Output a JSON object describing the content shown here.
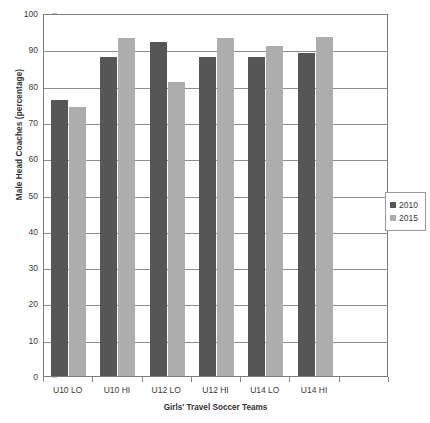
{
  "chart_data": {
    "type": "bar",
    "title": "",
    "xlabel": "Girls' Travel Soccer Teams",
    "ylabel": "Male Head Coaches (percentage)",
    "categories": [
      "U10 LO",
      "U10 HI",
      "U12 LO",
      "U12 HI",
      "U14 LO",
      "U14 HI"
    ],
    "series": [
      {
        "name": "2010",
        "color": "#565656",
        "values": [
          76,
          88,
          92,
          88,
          88,
          89
        ]
      },
      {
        "name": "2015",
        "color": "#adadad",
        "values": [
          74,
          93,
          81,
          93,
          91,
          93.5
        ]
      }
    ],
    "ylim": [
      0,
      100
    ],
    "yticks": [
      0,
      10,
      20,
      30,
      40,
      50,
      60,
      70,
      80,
      90,
      100
    ],
    "ytick_labels": [
      "0",
      "10",
      "20",
      "30",
      "40",
      "50",
      "60",
      "70",
      "80",
      "90",
      "100"
    ],
    "grid": "horizontal",
    "legend_position": "right",
    "legend_entries": [
      "2010",
      "2015"
    ]
  },
  "axes": {
    "y_title": "Male Head Coaches (percentage)",
    "x_title": "Girls' Travel Soccer Teams"
  },
  "legend": {
    "items": [
      {
        "label": "2010",
        "color": "#565656"
      },
      {
        "label": "2015",
        "color": "#adadad"
      }
    ]
  }
}
